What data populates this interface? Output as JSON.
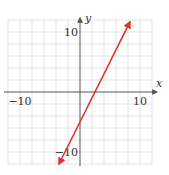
{
  "chart_data": {
    "type": "line",
    "title": "",
    "xlabel": "x",
    "ylabel": "y",
    "xlim": [
      -12,
      12
    ],
    "ylim": [
      -12,
      12
    ],
    "grid": true,
    "grid_step": 2,
    "x_tick_labels": [
      {
        "value": -10,
        "label": "−10"
      },
      {
        "value": 10,
        "label": "10"
      }
    ],
    "y_tick_labels": [
      {
        "value": 10,
        "label": "10"
      },
      {
        "value": -10,
        "label": "−10"
      }
    ],
    "series": [
      {
        "name": "y = 2x − 5",
        "equation": {
          "slope": 2,
          "intercept": -5
        },
        "x": [
          -3.5,
          8.33
        ],
        "y": [
          -12,
          11.67
        ],
        "color": "#d9382c",
        "arrows": "both"
      }
    ]
  }
}
